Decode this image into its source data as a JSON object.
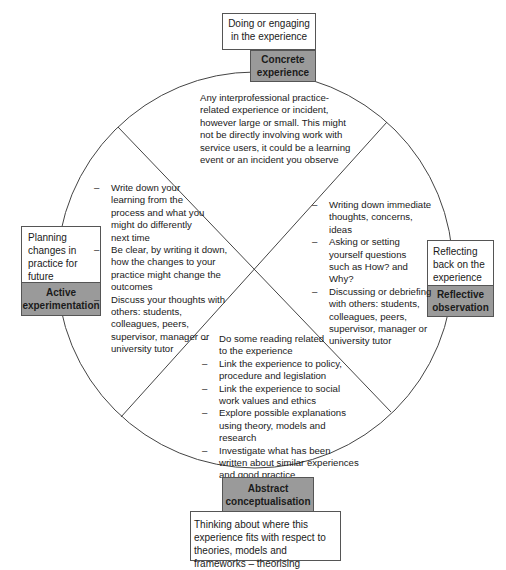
{
  "diagram": {
    "type": "cycle",
    "stages": {
      "top": {
        "description": "Doing or engaging in the experience",
        "label": "Concrete experience",
        "detail": "Any interprofessional practice-related experience or incident, however large or small. This might not be directly involving work with service users, it could be a learning event or an incident you observe"
      },
      "right": {
        "description": "Reflecting back on the experience",
        "label": "Reflective observation",
        "bullets": [
          "Writing down immediate thoughts, concerns, ideas",
          "Asking or setting yourself questions such as How? and Why?",
          "Discussing or debriefing with others: students, colleagues, peers, supervisor, manager or university tutor"
        ]
      },
      "bottom": {
        "description": "Thinking about where this experience fits with respect to theories, models and frameworks – theorising",
        "label": "Abstract conceptualisation",
        "bullets": [
          "Do some reading related to the experience",
          "Link the experience to policy, procedure and legislation",
          "Link the experience to social work values and ethics",
          "Explore possible explanations using theory, models and research",
          "Investigate what has been written about similar experiences and good practice"
        ]
      },
      "left": {
        "description": "Planning changes in practice for future experiences and redoing",
        "label": "Active experimentation",
        "bullets": [
          "Write down your learning from the process and what you might do differently next time",
          "Be clear, by writing it down, how the changes to your practice might change the outcomes",
          "Discuss your thoughts with others: students, colleagues, peers, supervisor, manager or university tutor"
        ]
      }
    },
    "colors": {
      "label_fill": "#9a9a9a",
      "line": "#444444",
      "box_border": "#555555"
    }
  }
}
